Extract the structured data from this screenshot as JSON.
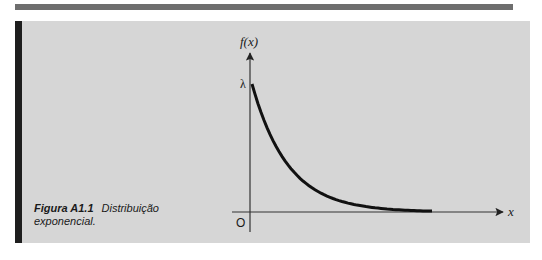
{
  "figure": {
    "label": "Figura A1.1",
    "caption_line1": "Distribuição",
    "caption_line2": "exponencial."
  },
  "chart_data": {
    "type": "line",
    "title": "Distribuição exponencial",
    "function": "f(x) = λ·e^(−λx)",
    "xlabel": "x",
    "ylabel": "f(x)",
    "y_tick_labels": [
      "λ"
    ],
    "origin_label": "O",
    "grid": false,
    "legend": "none",
    "xlim_units_of_inv_lambda": [
      0,
      5
    ],
    "ylim_units_of_lambda": [
      0,
      1
    ],
    "series": [
      {
        "name": "f(x)",
        "x_over_inv_lambda": [
          0,
          0.25,
          0.5,
          0.75,
          1,
          1.5,
          2,
          2.5,
          3,
          3.5,
          4,
          4.5,
          5
        ],
        "y_over_lambda": [
          1,
          0.779,
          0.607,
          0.472,
          0.368,
          0.223,
          0.135,
          0.082,
          0.05,
          0.03,
          0.018,
          0.011,
          0.007
        ]
      }
    ],
    "colors": {
      "curve": "#111111",
      "axes": "#333333"
    }
  }
}
